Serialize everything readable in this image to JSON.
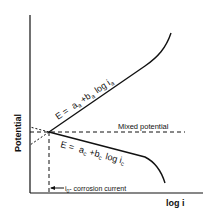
{
  "diagram": {
    "type": "evans-diagram",
    "y_axis_label": "Potential",
    "x_axis_label": "log i",
    "anodic_equation": {
      "E": "E =",
      "a": "a",
      "a_sub": "a",
      "plus": "+",
      "b": "b",
      "b_sub": "a",
      "log": "log i",
      "i_sub": "a"
    },
    "cathodic_equation": {
      "E": "E =",
      "a": "a",
      "a_sub": "c",
      "plus": "+",
      "b": "b",
      "b_sub": "c",
      "log": "log i",
      "i_sub": "c"
    },
    "mixed_potential_label": "Mixed potential",
    "corrosion_current_label": {
      "i": "i",
      "sub": "0",
      "text": "- corrosion current"
    },
    "line_color": "#111111"
  }
}
